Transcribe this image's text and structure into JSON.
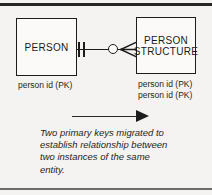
{
  "figure": {
    "type": "entity-relationship-diagram",
    "background_color": "#f4f3f1",
    "ink_color": "#1c1c1c"
  },
  "entities": [
    {
      "id": "person",
      "label": "PERSON",
      "attributes": "person id (PK)"
    },
    {
      "id": "person_structure",
      "label": "PERSON\nSTRUCTURE",
      "attributes": "person id (PK)\nperson id (PK)"
    }
  ],
  "relationship": {
    "left_notation": "one-and-only-one-double-tick",
    "middle_notation": "optional-zero-circle",
    "right_notation": "crows-foot-many",
    "from": "PERSON",
    "to": "PERSON STRUCTURE"
  },
  "annotation": {
    "arrow": "right-arrow",
    "caption_lines": [
      "Two primary keys migrated to",
      "establish relationship between",
      "two instances of the same",
      "entity."
    ]
  }
}
